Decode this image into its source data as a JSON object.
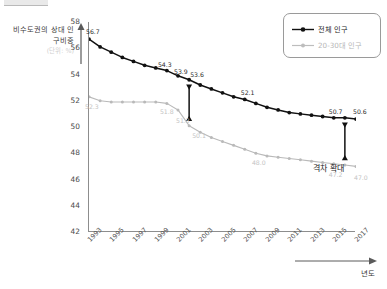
{
  "chart_data": {
    "type": "line",
    "title": "",
    "xlabel": "년도",
    "ylabel": "비수도권의 상대 인구비중",
    "ylabel_faint": "(단위: %)",
    "ylim": [
      42,
      58
    ],
    "yticks": [
      "42",
      "44",
      "46",
      "48",
      "50",
      "52",
      "54",
      "56",
      "58"
    ],
    "grid": false,
    "legend_position": "top-right",
    "x": [
      1993,
      1994,
      1995,
      1996,
      1997,
      1998,
      1999,
      2000,
      2001,
      2002,
      2003,
      2004,
      2005,
      2006,
      2007,
      2008,
      2009,
      2010,
      2011,
      2012,
      2013,
      2014,
      2015,
      2016,
      2017
    ],
    "xticks": [
      "1993",
      "1995",
      "1997",
      "1999",
      "2001",
      "2003",
      "2005",
      "2007",
      "2009",
      "2011",
      "2013",
      "2015",
      "2017"
    ],
    "series": [
      {
        "name": "전체 인구",
        "color": "#111111",
        "values": [
          56.7,
          56.1,
          55.7,
          55.3,
          55.0,
          54.7,
          54.5,
          54.3,
          53.9,
          53.6,
          53.2,
          52.9,
          52.6,
          52.3,
          52.1,
          51.8,
          51.5,
          51.3,
          51.1,
          51.0,
          50.9,
          50.8,
          50.7,
          50.7,
          50.6
        ]
      },
      {
        "name": "20-30대 인구",
        "color": "#b9b9b9",
        "values": [
          52.3,
          52.0,
          51.9,
          51.9,
          51.9,
          51.9,
          51.9,
          51.8,
          51.3,
          50.1,
          49.6,
          49.2,
          48.9,
          48.6,
          48.3,
          48.0,
          47.8,
          47.7,
          47.6,
          47.5,
          47.4,
          47.3,
          47.2,
          47.1,
          47.0
        ]
      }
    ],
    "point_labels": [
      {
        "series": "전체 인구",
        "year": 1993,
        "text": "56.7"
      },
      {
        "series": "전체 인구",
        "year": 2000,
        "text": "54.3"
      },
      {
        "series": "전체 인구",
        "year": 2001,
        "text": "53.9"
      },
      {
        "series": "전체 인구",
        "year": 2002,
        "text": "53.6"
      },
      {
        "series": "전체 인구",
        "year": 2007,
        "text": "52.1"
      },
      {
        "series": "전체 인구",
        "year": 2015,
        "text": "50.7"
      },
      {
        "series": "전체 인구",
        "year": 2017,
        "text": "50.6"
      },
      {
        "series": "20-30대 인구",
        "year": 1993,
        "text": "52.3"
      },
      {
        "series": "20-30대 인구",
        "year": 2000,
        "text": "51.8"
      },
      {
        "series": "20-30대 인구",
        "year": 2001,
        "text": "51.3"
      },
      {
        "series": "20-30대 인구",
        "year": 2002,
        "text": "50.1"
      },
      {
        "series": "20-30대 인구",
        "year": 2008,
        "text": "48.0"
      },
      {
        "series": "20-30대 인구",
        "year": 2015,
        "text": "47.2"
      },
      {
        "series": "20-30대 인구",
        "year": 2017,
        "text": "47.0"
      }
    ],
    "annotations": [
      {
        "name": "gap-arrow-early",
        "text": "",
        "year": 2002
      },
      {
        "name": "gap-arrow-late",
        "text": "격차 확대",
        "year": 2016
      }
    ]
  },
  "legend": {
    "items": [
      {
        "label": "전체 인구"
      },
      {
        "label": "20-30대 인구"
      }
    ]
  },
  "annotation_labels": {
    "gap_widening": "격차 확대"
  }
}
